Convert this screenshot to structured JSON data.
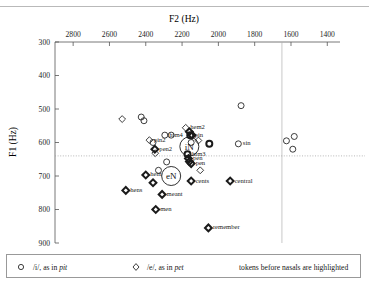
{
  "chart_data": {
    "type": "scatter",
    "title": "",
    "xlabel": "F2 (Hz)",
    "ylabel": "F1 (Hz)",
    "xlim": [
      2900,
      1330
    ],
    "ylim": [
      900,
      300
    ],
    "x_axis_position": "top",
    "y_axis_inverted": true,
    "x_ticks": [
      2800,
      2600,
      2400,
      2200,
      2000,
      1800,
      1600,
      1400
    ],
    "y_ticks": [
      300,
      400,
      500,
      600,
      700,
      800,
      900
    ],
    "grid": false,
    "legend_position": "bottom",
    "annotations": {
      "horizontal_reference_line": {
        "y": 640,
        "style": "dotted"
      },
      "vertical_reference_line": {
        "x": 1650,
        "style": "solid-light"
      },
      "cluster_centroid_i": {
        "label": "iN",
        "x": 2160,
        "y": 612
      },
      "cluster_centroid_e": {
        "label": "eN",
        "x": 2260,
        "y": 700
      }
    },
    "series": [
      {
        "name": "/i/, as in pit",
        "marker": "circle",
        "points": [
          {
            "x": 2425,
            "y": 524,
            "label": "",
            "highlighted": false
          },
          {
            "x": 2410,
            "y": 535,
            "label": "",
            "highlighted": false
          },
          {
            "x": 2295,
            "y": 578,
            "label": "him4",
            "highlighted": false
          },
          {
            "x": 2260,
            "y": 578,
            "label": "",
            "highlighted": false
          },
          {
            "x": 2155,
            "y": 578,
            "label": "pin",
            "highlighted": true
          },
          {
            "x": 2360,
            "y": 600,
            "label": "",
            "highlighted": false
          },
          {
            "x": 2150,
            "y": 600,
            "label": "",
            "highlighted": false
          },
          {
            "x": 2170,
            "y": 635,
            "label": "him3",
            "highlighted": true
          },
          {
            "x": 1875,
            "y": 490,
            "label": "",
            "highlighted": false
          },
          {
            "x": 1890,
            "y": 604,
            "label": "sin",
            "highlighted": false
          },
          {
            "x": 2050,
            "y": 604,
            "label": "",
            "highlighted": true
          },
          {
            "x": 1625,
            "y": 595,
            "label": "",
            "highlighted": false
          },
          {
            "x": 1582,
            "y": 582,
            "label": "",
            "highlighted": false
          },
          {
            "x": 1590,
            "y": 620,
            "label": "",
            "highlighted": false
          },
          {
            "x": 2330,
            "y": 683,
            "label": "",
            "highlighted": false
          },
          {
            "x": 2285,
            "y": 658,
            "label": "",
            "highlighted": false
          }
        ]
      },
      {
        "name": "/e/, as in pet",
        "marker": "diamond",
        "points": [
          {
            "x": 2530,
            "y": 530,
            "label": "",
            "highlighted": false
          },
          {
            "x": 2180,
            "y": 556,
            "label": "hem2",
            "highlighted": false
          },
          {
            "x": 2160,
            "y": 568,
            "label": "",
            "highlighted": true
          },
          {
            "x": 2145,
            "y": 578,
            "label": "",
            "highlighted": true
          },
          {
            "x": 2380,
            "y": 593,
            "label": "pin2",
            "highlighted": false
          },
          {
            "x": 2110,
            "y": 594,
            "label": "",
            "highlighted": false
          },
          {
            "x": 2350,
            "y": 620,
            "label": "pen2",
            "highlighted": true
          },
          {
            "x": 2348,
            "y": 632,
            "label": "",
            "highlighted": false
          },
          {
            "x": 2165,
            "y": 648,
            "label": "pen",
            "highlighted": true
          },
          {
            "x": 2160,
            "y": 657,
            "label": "",
            "highlighted": true
          },
          {
            "x": 2150,
            "y": 663,
            "label": "pen",
            "highlighted": true
          },
          {
            "x": 2400,
            "y": 697,
            "label": "hem",
            "highlighted": true
          },
          {
            "x": 2360,
            "y": 720,
            "label": "",
            "highlighted": true
          },
          {
            "x": 2100,
            "y": 683,
            "label": "",
            "highlighted": false
          },
          {
            "x": 2150,
            "y": 715,
            "label": "cents",
            "highlighted": true
          },
          {
            "x": 2510,
            "y": 743,
            "label": "hens",
            "highlighted": true
          },
          {
            "x": 2310,
            "y": 755,
            "label": "meant",
            "highlighted": true
          },
          {
            "x": 2345,
            "y": 800,
            "label": "men",
            "highlighted": true
          },
          {
            "x": 2055,
            "y": 855,
            "label": "remember",
            "highlighted": true
          },
          {
            "x": 1935,
            "y": 715,
            "label": "central",
            "highlighted": true
          }
        ]
      }
    ]
  },
  "legend": {
    "items": [
      {
        "marker": "circle",
        "symbol": "/i/, as in ",
        "word": "pit"
      },
      {
        "marker": "diamond",
        "symbol": "/e/, as in ",
        "word": "pet"
      }
    ],
    "note": "tokens before nasals are highlighted"
  }
}
